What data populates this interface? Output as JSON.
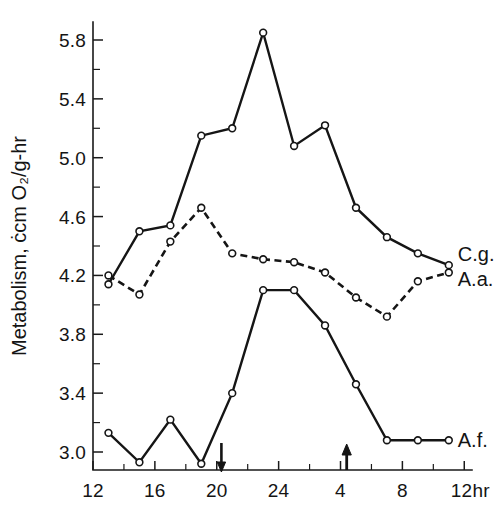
{
  "chart_data": {
    "type": "line",
    "title": "",
    "xlabel": "",
    "ylabel": "Metabolism, ccm O2/g-hr",
    "ylabel_display": "Metabolism, ċcm O₂/g-hr",
    "xlim": [
      12,
      12.5
    ],
    "ylim": [
      2.82,
      5.95
    ],
    "grid": false,
    "legend_position": "inline-right",
    "x_tick_labels": [
      "12",
      "16",
      "20",
      "24",
      "4",
      "8",
      "12hr"
    ],
    "x_tick_hours": [
      12,
      16,
      20,
      24,
      28,
      32,
      36
    ],
    "x_minor_tick_hours": [
      14,
      18,
      22,
      26,
      30,
      34
    ],
    "y_tick_labels": [
      "5.8",
      "5.4",
      "5.0",
      "4.6",
      "4.2",
      "3.8",
      "3.4",
      "3.0"
    ],
    "y_tick_values": [
      5.8,
      5.4,
      5.0,
      4.6,
      4.2,
      3.8,
      3.4,
      3.0
    ],
    "y_minor_tick_values": [
      5.6,
      5.2,
      4.8,
      4.4,
      4.0,
      3.6,
      3.2
    ],
    "annotations": [
      {
        "name": "sunset-arrow",
        "hour": 20.3,
        "direction": "down",
        "label": ""
      },
      {
        "name": "sunrise-arrow",
        "hour": 28.4,
        "direction": "up",
        "label": ""
      }
    ],
    "series": [
      {
        "name": "C.g.",
        "label": "C.g.",
        "style": "solid",
        "marker": "open-circle",
        "x": [
          13.0,
          15.0,
          17.0,
          19.0,
          21.0,
          23.0,
          25.0,
          27.0,
          29.0,
          31.0,
          33.0,
          35.0
        ],
        "values": [
          4.14,
          4.5,
          4.54,
          5.15,
          5.2,
          5.85,
          5.08,
          5.22,
          4.66,
          4.46,
          4.35,
          4.27
        ]
      },
      {
        "name": "A.a.",
        "label": "A.a.",
        "style": "dashed",
        "marker": "open-circle",
        "x": [
          13.0,
          15.0,
          17.0,
          19.0,
          21.0,
          23.0,
          25.0,
          27.0,
          29.0,
          31.0,
          33.0,
          35.0
        ],
        "values": [
          4.2,
          4.07,
          4.43,
          4.66,
          4.35,
          4.31,
          4.29,
          4.22,
          4.05,
          3.92,
          4.16,
          4.22
        ]
      },
      {
        "name": "A.f.",
        "label": "A.f.",
        "style": "solid",
        "marker": "open-circle",
        "x": [
          13.0,
          15.0,
          17.0,
          19.0,
          21.0,
          23.0,
          25.0,
          27.0,
          29.0,
          31.0,
          33.0,
          35.0
        ],
        "values": [
          3.13,
          2.93,
          3.22,
          2.92,
          3.4,
          4.1,
          4.1,
          3.86,
          3.46,
          3.08,
          3.08,
          3.08
        ]
      }
    ]
  },
  "axis_titles": {
    "y": "Metabolism, ċcm O₂/g-hr"
  },
  "series_labels": {
    "cg": "C.g.",
    "aa": "A.a.",
    "af": "A.f."
  }
}
